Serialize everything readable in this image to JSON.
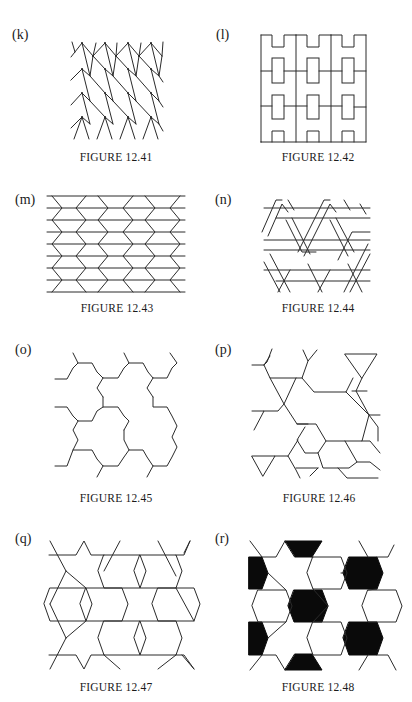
{
  "page": {
    "figures": [
      {
        "label": "(k)",
        "caption": "FIGURE 12.41",
        "pattern": "zigzag-arrows"
      },
      {
        "label": "(l)",
        "caption": "FIGURE 12.42",
        "pattern": "h-shapes"
      },
      {
        "label": "(m)",
        "caption": "FIGURE 12.43",
        "pattern": "horizontal-chevrons"
      },
      {
        "label": "(n)",
        "caption": "FIGURE 12.44",
        "pattern": "woven-parallelograms"
      },
      {
        "label": "(o)",
        "caption": "FIGURE 12.45",
        "pattern": "hexagonal-tripods"
      },
      {
        "label": "(p)",
        "caption": "FIGURE 12.46",
        "pattern": "triangles-hexagons"
      },
      {
        "label": "(q)",
        "caption": "FIGURE 12.47",
        "pattern": "hexagons-stars"
      },
      {
        "label": "(r)",
        "caption": "FIGURE 12.48",
        "pattern": "hexagons-stars-shaded"
      }
    ]
  },
  "colors": {
    "ink": "#2a2a2a",
    "fill": "#0a0a0a",
    "paper": "#ffffff"
  }
}
